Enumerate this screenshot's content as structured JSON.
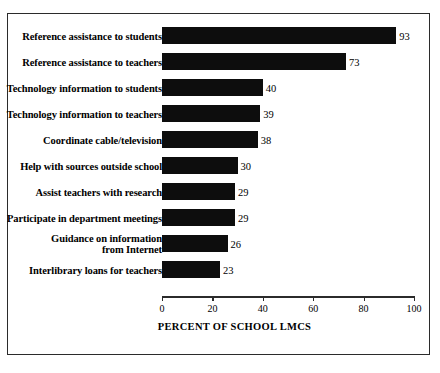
{
  "figure": {
    "top_remnant_text": "",
    "background_color": "#ffffff",
    "frame_color": "#2b2b2b",
    "bar_color": "#0d0d0d"
  },
  "chart_data": {
    "type": "bar",
    "orientation": "horizontal",
    "title": "",
    "xlabel": "PERCENT OF SCHOOL LMCS",
    "ylabel": "",
    "xlim": [
      0,
      100
    ],
    "xticks": [
      0,
      20,
      40,
      60,
      80,
      100
    ],
    "xtick_labels": [
      "0",
      "20",
      "40",
      "60",
      "80",
      "100"
    ],
    "grid": false,
    "legend": false,
    "value_labels": true,
    "categories": [
      "Reference assistance to students",
      "Reference assistance to teachers",
      "Technology information to students",
      "Technology information to teachers",
      "Coordinate cable/television",
      "Help with sources outside school",
      "Assist teachers with research",
      "Participate in department meetings",
      "Guidance on information\nfrom Internet",
      "Interlibrary loans for teachers"
    ],
    "values": [
      93,
      73,
      40,
      39,
      38,
      30,
      29,
      29,
      26,
      23
    ],
    "value_label_text": [
      "93",
      "73",
      "40",
      "39",
      "38",
      "30",
      "29",
      "29",
      "26",
      "23"
    ]
  }
}
